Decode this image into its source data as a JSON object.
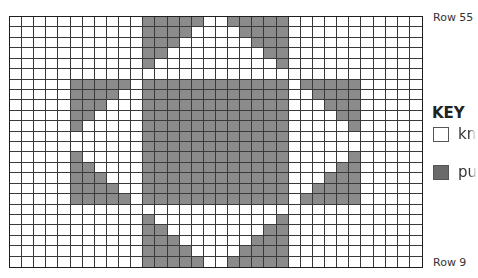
{
  "chart": {
    "columns": 34,
    "rows": 24,
    "top_row_label": "Row 55",
    "bottom_row_label": "Row 9",
    "colors": {
      "knit": "#ffffff",
      "purl": "#8b8b8b",
      "grid_line": "#3a3a3a"
    },
    "purl_cells_by_row": [
      [
        [
          11,
          15
        ],
        [
          18,
          22
        ]
      ],
      [
        [
          11,
          14
        ],
        [
          19,
          22
        ]
      ],
      [
        [
          11,
          13
        ],
        [
          20,
          22
        ]
      ],
      [
        [
          11,
          12
        ],
        [
          21,
          22
        ]
      ],
      [
        [
          11,
          11
        ],
        [
          22,
          22
        ]
      ],
      [],
      [
        [
          5,
          9
        ],
        [
          11,
          22
        ],
        [
          24,
          28
        ]
      ],
      [
        [
          5,
          8
        ],
        [
          11,
          22
        ],
        [
          25,
          28
        ]
      ],
      [
        [
          5,
          7
        ],
        [
          11,
          22
        ],
        [
          26,
          28
        ]
      ],
      [
        [
          5,
          6
        ],
        [
          11,
          22
        ],
        [
          27,
          28
        ]
      ],
      [
        [
          5,
          5
        ],
        [
          11,
          22
        ],
        [
          28,
          28
        ]
      ],
      [
        [
          11,
          22
        ]
      ],
      [
        [
          11,
          22
        ]
      ],
      [
        [
          5,
          5
        ],
        [
          11,
          22
        ],
        [
          28,
          28
        ]
      ],
      [
        [
          5,
          6
        ],
        [
          11,
          22
        ],
        [
          27,
          28
        ]
      ],
      [
        [
          5,
          7
        ],
        [
          11,
          22
        ],
        [
          26,
          28
        ]
      ],
      [
        [
          5,
          8
        ],
        [
          11,
          22
        ],
        [
          25,
          28
        ]
      ],
      [
        [
          5,
          9
        ],
        [
          11,
          22
        ],
        [
          24,
          28
        ]
      ],
      [],
      [
        [
          11,
          11
        ],
        [
          22,
          22
        ]
      ],
      [
        [
          11,
          12
        ],
        [
          21,
          22
        ]
      ],
      [
        [
          11,
          13
        ],
        [
          20,
          22
        ]
      ],
      [
        [
          11,
          14
        ],
        [
          19,
          22
        ]
      ],
      [
        [
          11,
          15
        ],
        [
          18,
          22
        ]
      ]
    ]
  },
  "key": {
    "title": "KEY",
    "items": [
      {
        "label": "kn",
        "swatch": "white-square",
        "color": "#ffffff"
      },
      {
        "label": "pu",
        "swatch": "dark-gray-square",
        "color": "#6a6a6a"
      }
    ]
  }
}
